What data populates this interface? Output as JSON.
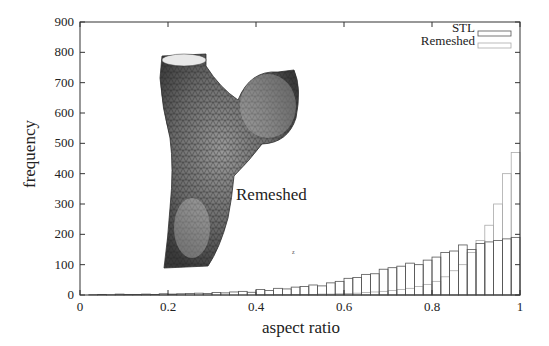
{
  "chart_data": {
    "type": "bar",
    "title": "",
    "xlabel": "aspect ratio",
    "ylabel": "frequency",
    "xlim": [
      0,
      1
    ],
    "ylim": [
      0,
      900
    ],
    "xticks": [
      "0",
      "0.2",
      "0.4",
      "0.6",
      "0.8",
      "1"
    ],
    "yticks": [
      "0",
      "100",
      "200",
      "300",
      "400",
      "500",
      "600",
      "700",
      "800",
      "900"
    ],
    "grid": false,
    "legend_position": "top-right",
    "bin_width": 0.02,
    "x": [
      0.01,
      0.03,
      0.05,
      0.07,
      0.09,
      0.11,
      0.13,
      0.15,
      0.17,
      0.19,
      0.21,
      0.23,
      0.25,
      0.27,
      0.29,
      0.31,
      0.33,
      0.35,
      0.37,
      0.39,
      0.41,
      0.43,
      0.45,
      0.47,
      0.49,
      0.51,
      0.53,
      0.55,
      0.57,
      0.59,
      0.61,
      0.63,
      0.65,
      0.67,
      0.69,
      0.71,
      0.73,
      0.75,
      0.77,
      0.79,
      0.81,
      0.83,
      0.85,
      0.87,
      0.89,
      0.91,
      0.93,
      0.95,
      0.97,
      0.99
    ],
    "series": [
      {
        "name": "STL",
        "color": "#555555",
        "values": [
          0,
          1,
          2,
          1,
          3,
          2,
          2,
          3,
          2,
          4,
          3,
          4,
          5,
          6,
          5,
          8,
          7,
          10,
          12,
          9,
          18,
          15,
          22,
          20,
          26,
          28,
          33,
          30,
          40,
          45,
          55,
          58,
          68,
          70,
          85,
          90,
          95,
          105,
          100,
          115,
          125,
          140,
          145,
          165,
          150,
          170,
          175,
          180,
          185,
          190
        ]
      },
      {
        "name": "Remeshed",
        "color": "#aaaaaa",
        "values": [
          0,
          0,
          0,
          0,
          0,
          0,
          0,
          0,
          0,
          0,
          0,
          0,
          0,
          0,
          0,
          0,
          0,
          0,
          0,
          0,
          1,
          1,
          1,
          1,
          2,
          2,
          2,
          3,
          3,
          4,
          5,
          6,
          8,
          10,
          12,
          15,
          18,
          22,
          28,
          35,
          45,
          60,
          80,
          100,
          140,
          180,
          230,
          300,
          400,
          470
        ]
      }
    ],
    "annotations": [
      {
        "text": "Remeshed",
        "x": 0.36,
        "y": 320
      },
      {
        "text": "3D mesh image of a vessel with aneurysm (inset)",
        "kind": "image"
      }
    ]
  },
  "legend": {
    "stl_label": "STL",
    "remeshed_label": "Remeshed"
  },
  "axes": {
    "xlabel": "aspect ratio",
    "ylabel": "frequency"
  },
  "inset": {
    "label": "Remeshed",
    "axis_glyph": "z"
  }
}
